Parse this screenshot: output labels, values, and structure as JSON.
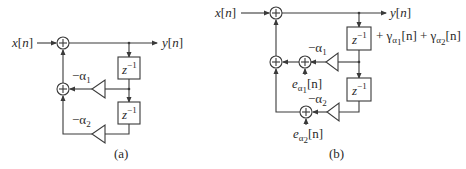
{
  "figure": {
    "panel_a": {
      "caption": "(a)",
      "input_label": "x[n]",
      "output_label": "y[n]",
      "delay_label": "z",
      "delay_exp": "−1",
      "coef1": {
        "sign": "−",
        "sym": "α",
        "sub": "1"
      },
      "coef2": {
        "sign": "−",
        "sym": "α",
        "sub": "2"
      }
    },
    "panel_b": {
      "caption": "(b)",
      "input_label": "x[n]",
      "output_label": "y[n]",
      "output_extra": {
        "plus1": "+ ",
        "g1": "γ",
        "g1_sub_sym": "α",
        "g1_sub_sub": "1",
        "g1_arg": "[n]",
        "plus2": " + ",
        "g2": "γ",
        "g2_sub_sym": "α",
        "g2_sub_sub": "2",
        "g2_arg": "[n]"
      },
      "delay_label": "z",
      "delay_exp": "−1",
      "coef1": {
        "sign": "−",
        "sym": "α",
        "sub": "1"
      },
      "coef2": {
        "sign": "−",
        "sym": "α",
        "sub": "2"
      },
      "err1": {
        "e": "e",
        "sym": "α",
        "sub": "1",
        "arg": "[n]"
      },
      "err2": {
        "e": "e",
        "sym": "α",
        "sub": "2",
        "arg": "[n]"
      }
    },
    "adder_symbol": "+"
  }
}
